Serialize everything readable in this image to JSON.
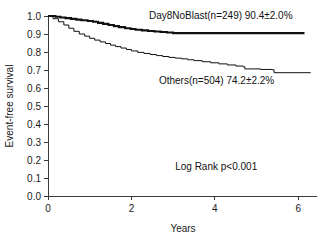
{
  "chart_data": {
    "type": "line",
    "subtype": "kaplan-meier-step",
    "title": "",
    "xlabel": "Years",
    "ylabel": "Event-free survival",
    "xlim": [
      0,
      6.45
    ],
    "ylim": [
      0.0,
      1.0
    ],
    "xticks": [
      0,
      2,
      4,
      6
    ],
    "xtick_labels": [
      "0",
      "2",
      "4",
      "6"
    ],
    "yticks": [
      0.0,
      0.1,
      0.2,
      0.3,
      0.4,
      0.5,
      0.6,
      0.7,
      0.8,
      0.9,
      1.0
    ],
    "ytick_labels": [
      "0.0",
      "0.1",
      "0.2",
      "0.3",
      "0.4",
      "0.5",
      "0.6",
      "0.7",
      "0.8",
      "0.9",
      "1.0"
    ],
    "grid": false,
    "legend_position": "inline-annotation",
    "series": [
      {
        "name": "Day8NoBlast",
        "label": "Day8NoBlast(n=249)  90.4±2.0%",
        "group_label": "Day8NoBlast(n=249)",
        "estimate_label": "90.4±2.0%",
        "n": 249,
        "survival_percent": 90.4,
        "survival_se": 2.0,
        "line_style": "thick",
        "x": [
          0.0,
          0.18,
          0.3,
          0.42,
          0.55,
          0.68,
          0.8,
          0.95,
          1.08,
          1.2,
          1.32,
          1.45,
          1.58,
          1.7,
          1.85,
          1.98,
          2.1,
          2.25,
          2.4,
          2.55,
          2.7,
          2.85,
          3.0,
          6.15
        ],
        "y": [
          1.0,
          0.996,
          0.992,
          0.988,
          0.984,
          0.98,
          0.976,
          0.972,
          0.968,
          0.962,
          0.956,
          0.95,
          0.944,
          0.938,
          0.932,
          0.928,
          0.924,
          0.92,
          0.917,
          0.914,
          0.911,
          0.908,
          0.905,
          0.905
        ]
      },
      {
        "name": "Others",
        "label": "Others(n=504)  74.2±2.2%",
        "group_label": "Others(n=504)",
        "estimate_label": "74.2±2.2%",
        "n": 504,
        "survival_percent": 74.2,
        "survival_se": 2.2,
        "line_style": "thin",
        "x": [
          0.0,
          0.12,
          0.25,
          0.38,
          0.5,
          0.62,
          0.75,
          0.88,
          1.0,
          1.12,
          1.25,
          1.38,
          1.5,
          1.62,
          1.75,
          1.88,
          2.0,
          2.15,
          2.3,
          2.45,
          2.6,
          2.75,
          2.9,
          3.05,
          3.2,
          3.35,
          3.5,
          3.7,
          3.9,
          4.1,
          4.3,
          4.5,
          4.68,
          4.72,
          5.1,
          5.38,
          5.42,
          6.3
        ],
        "y": [
          1.0,
          0.985,
          0.968,
          0.95,
          0.932,
          0.915,
          0.9,
          0.888,
          0.876,
          0.866,
          0.856,
          0.847,
          0.838,
          0.83,
          0.822,
          0.814,
          0.806,
          0.798,
          0.792,
          0.786,
          0.78,
          0.775,
          0.77,
          0.766,
          0.762,
          0.757,
          0.752,
          0.746,
          0.74,
          0.734,
          0.728,
          0.722,
          0.718,
          0.706,
          0.703,
          0.701,
          0.685,
          0.685
        ]
      }
    ],
    "annotations": [
      {
        "name": "log-rank-test",
        "text": "Log Rank p<0.001",
        "x": 3.05,
        "y": 0.145
      }
    ],
    "series_label_positions": [
      {
        "series": "Day8NoBlast",
        "x": 2.42,
        "y": 0.985
      },
      {
        "series": "Others",
        "x": 2.66,
        "y": 0.625
      }
    ]
  }
}
